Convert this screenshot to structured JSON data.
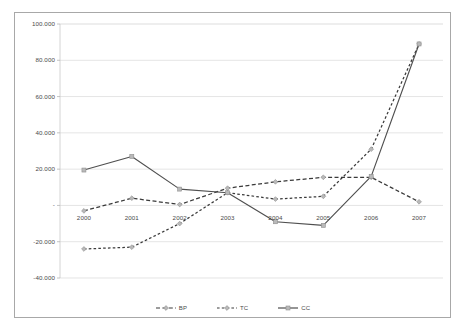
{
  "chart_data": {
    "type": "line",
    "title": "",
    "subtitle": "",
    "xlabel": "",
    "ylabel": "",
    "categories": [
      "2000",
      "2001",
      "2002",
      "2003",
      "2004",
      "2005",
      "2006",
      "2007"
    ],
    "ylim": [
      -40000,
      100000
    ],
    "ytick_labels": [
      "100.000",
      "80.000",
      "60.000",
      "40.000",
      "20.000",
      "-",
      "-20.000",
      "-40.000"
    ],
    "ytick_values": [
      100000,
      80000,
      60000,
      40000,
      20000,
      0,
      -20000,
      -40000
    ],
    "grid": true,
    "legend_position": "bottom",
    "series": [
      {
        "name": "BP",
        "style": "short-dashed",
        "color": "#3a3a3a",
        "marker": "diamond",
        "values": [
          -3000,
          4000,
          500,
          9500,
          13000,
          15500,
          15500,
          2000
        ]
      },
      {
        "name": "TC",
        "style": "long-dashed",
        "color": "#3a3a3a",
        "marker": "diamond",
        "values": [
          -24000,
          -23000,
          -10000,
          7000,
          3500,
          5000,
          31000,
          89000
        ]
      },
      {
        "name": "CC",
        "style": "solid",
        "color": "#4f4f4f",
        "marker": "square",
        "values": [
          19500,
          27000,
          9000,
          7000,
          -9000,
          -11000,
          16000,
          89000
        ]
      }
    ]
  },
  "legend": {
    "items": [
      {
        "label": "BP"
      },
      {
        "label": "TC"
      },
      {
        "label": "CC"
      }
    ]
  },
  "colors": {
    "frame_border": "#a8a8a8",
    "grid": "#d9d9d9",
    "axis_text": "#4a4a4a",
    "plot_background": "#ffffff"
  }
}
